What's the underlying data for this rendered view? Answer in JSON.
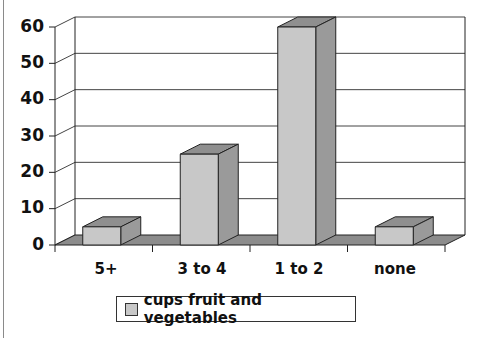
{
  "chart_data": {
    "type": "bar",
    "style": "3d-column",
    "title": "",
    "xlabel": "",
    "ylabel": "",
    "categories": [
      "5+",
      "3 to 4",
      "1 to 2",
      "none"
    ],
    "series": [
      {
        "name": "cups fruit and vegetables",
        "values": [
          5,
          25,
          60,
          5
        ]
      }
    ],
    "ylim": [
      0,
      60
    ],
    "yticks": [
      "0",
      "10",
      "20",
      "30",
      "40",
      "50",
      "60"
    ],
    "grid": true,
    "legend_position": "bottom",
    "colors": {
      "bar_front": "#c8c8c8",
      "bar_top": "#8f8f8f",
      "bar_side": "#9a9a9a",
      "floor": "#8c8c8c",
      "grid": "#444444"
    }
  },
  "axis": {
    "y_labels": [
      "60",
      "50",
      "40",
      "30",
      "20",
      "10",
      "0"
    ],
    "x_labels": [
      "5+",
      "3 to 4",
      "1 to 2",
      "none"
    ]
  },
  "legend": {
    "label": "cups fruit and vegetables"
  }
}
